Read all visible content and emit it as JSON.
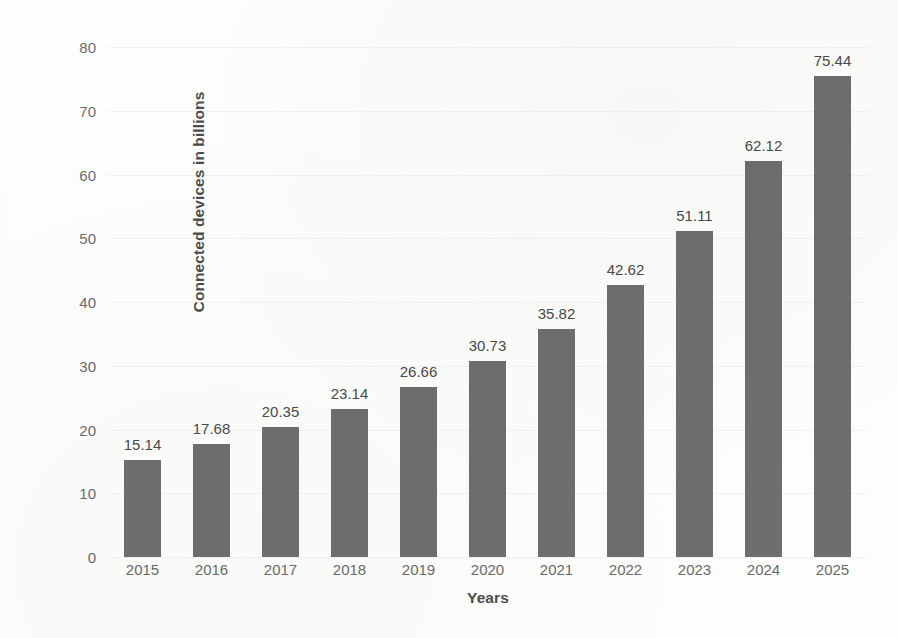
{
  "chart_data": {
    "type": "bar",
    "title": "",
    "subtitle": "",
    "xlabel": "Years",
    "ylabel": "Connected devices in billions",
    "categories": [
      "2015",
      "2016",
      "2017",
      "2018",
      "2019",
      "2020",
      "2021",
      "2022",
      "2023",
      "2024",
      "2025"
    ],
    "values": [
      15.14,
      17.68,
      20.35,
      23.14,
      26.66,
      30.73,
      35.82,
      42.62,
      51.11,
      62.12,
      75.44
    ],
    "data_labels": [
      "15.14",
      "17.68",
      "20.35",
      "23.14",
      "26.66",
      "30.73",
      "35.82",
      "42.62",
      "51.11",
      "62.12",
      "75.44"
    ],
    "ylim": [
      0,
      80
    ],
    "y_ticks": [
      0,
      10,
      20,
      30,
      40,
      50,
      60,
      70,
      80
    ],
    "y_tick_labels": [
      "0",
      "10",
      "20",
      "30",
      "40",
      "50",
      "60",
      "70",
      "80"
    ],
    "grid": true,
    "legend": false,
    "legend_position": "none",
    "bar_color": "#6e6e6e",
    "label_color": "#4a4a4a",
    "tick_color": "#6a6a6a",
    "axis_title_color": "#4c4c4c",
    "background_color": "#fdfdfc"
  }
}
